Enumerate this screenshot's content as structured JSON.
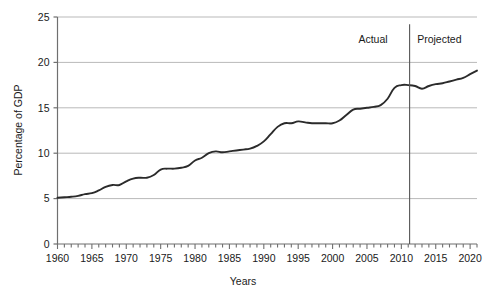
{
  "chart_data": {
    "type": "line",
    "title": "",
    "xlabel": "Years",
    "ylabel": "Percentage of GDP",
    "xlim": [
      1960,
      2021
    ],
    "ylim": [
      0,
      25
    ],
    "yticks": [
      0,
      5,
      10,
      15,
      20,
      25
    ],
    "ytick_labels": [
      "0",
      "5",
      "10",
      "15",
      "20",
      "25"
    ],
    "xticks": [
      1960,
      1965,
      1970,
      1975,
      1980,
      1985,
      1990,
      1995,
      2000,
      2005,
      2010,
      2015,
      2020
    ],
    "xtick_labels": [
      "1960",
      "1965",
      "1970",
      "1975",
      "1980",
      "1985",
      "1990",
      "1995",
      "2000",
      "2005",
      "2010",
      "2015",
      "2020"
    ],
    "minor_xtick_step": 1,
    "grid": "horizontal",
    "legend": "none",
    "line_color": "#2b2b2b",
    "grid_color": "#b9b9b9",
    "axis_color": "#6f6f6f",
    "annotations": [
      {
        "name": "actual-label",
        "text": "Actual",
        "x": 2008,
        "y": 22.1,
        "align": "right"
      },
      {
        "name": "projected-label",
        "text": "Projected",
        "x": 2012.3,
        "y": 22.1,
        "align": "left"
      },
      {
        "name": "divider",
        "type": "vline",
        "x": 2011.2,
        "y0": 0,
        "y1": 24.2
      }
    ],
    "x": [
      1960,
      1961,
      1962,
      1963,
      1964,
      1965,
      1966,
      1967,
      1968,
      1969,
      1970,
      1971,
      1972,
      1973,
      1974,
      1975,
      1976,
      1977,
      1978,
      1979,
      1980,
      1981,
      1982,
      1983,
      1984,
      1985,
      1986,
      1987,
      1988,
      1989,
      1990,
      1991,
      1992,
      1993,
      1994,
      1995,
      1996,
      1997,
      1998,
      1999,
      2000,
      2001,
      2002,
      2003,
      2004,
      2005,
      2006,
      2007,
      2008,
      2009,
      2010,
      2011,
      2012,
      2013,
      2014,
      2015,
      2016,
      2017,
      2018,
      2019,
      2020,
      2021
    ],
    "values": [
      5.1,
      5.15,
      5.2,
      5.3,
      5.5,
      5.6,
      5.9,
      6.3,
      6.5,
      6.5,
      6.9,
      7.2,
      7.3,
      7.3,
      7.6,
      8.2,
      8.3,
      8.3,
      8.4,
      8.6,
      9.2,
      9.5,
      10.0,
      10.2,
      10.1,
      10.2,
      10.3,
      10.4,
      10.5,
      10.8,
      11.3,
      12.1,
      12.9,
      13.3,
      13.3,
      13.5,
      13.4,
      13.3,
      13.3,
      13.3,
      13.3,
      13.6,
      14.2,
      14.8,
      14.9,
      15.0,
      15.1,
      15.3,
      16.0,
      17.2,
      17.5,
      17.5,
      17.4,
      17.1,
      17.4,
      17.6,
      17.7,
      17.9,
      18.1,
      18.3,
      18.7,
      19.1
    ],
    "series_name": "Percentage of GDP"
  },
  "axis": {
    "x_title": "Years",
    "y_title": "Percentage of GDP"
  }
}
